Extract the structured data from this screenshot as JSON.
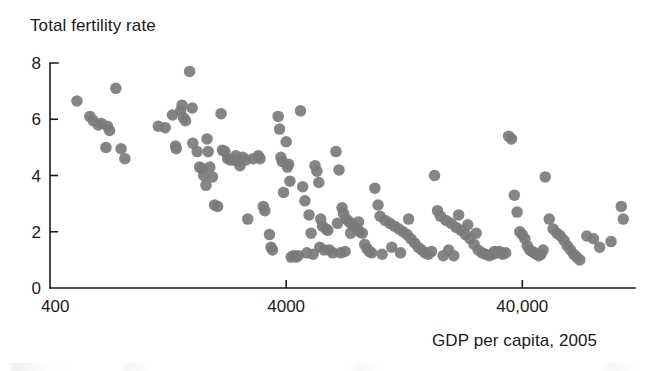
{
  "chart_data": {
    "type": "scatter",
    "title": "",
    "ylabel": "Total fertility rate",
    "xlabel": "GDP per capita, 2005",
    "xscale": "log",
    "yscale": "linear",
    "xtick_labels": [
      "400",
      "4000",
      "40,000"
    ],
    "xtick_values": [
      400,
      4000,
      40000
    ],
    "ytick_labels": [
      "0",
      "2",
      "4",
      "6",
      "8"
    ],
    "ytick_values": [
      0,
      2,
      4,
      6,
      8
    ],
    "xlim": [
      400,
      120000
    ],
    "ylim": [
      0,
      8
    ],
    "grid": false,
    "legend": null,
    "marker": {
      "shape": "circle",
      "color": "#7b7b7b",
      "diameter_px": 11.5
    },
    "points": [
      [
        520,
        6.65
      ],
      [
        590,
        6.1
      ],
      [
        610,
        5.95
      ],
      [
        640,
        5.8
      ],
      [
        660,
        5.85
      ],
      [
        700,
        5.75
      ],
      [
        715,
        5.6
      ],
      [
        690,
        5.0
      ],
      [
        760,
        7.1
      ],
      [
        800,
        4.95
      ],
      [
        830,
        4.6
      ],
      [
        1150,
        5.75
      ],
      [
        1230,
        5.7
      ],
      [
        1320,
        6.15
      ],
      [
        1360,
        5.05
      ],
      [
        1370,
        4.95
      ],
      [
        1430,
        6.3
      ],
      [
        1450,
        6.5
      ],
      [
        1470,
        6.05
      ],
      [
        1500,
        5.95
      ],
      [
        1560,
        7.7
      ],
      [
        1600,
        6.4
      ],
      [
        1610,
        5.15
      ],
      [
        1680,
        4.85
      ],
      [
        1720,
        4.3
      ],
      [
        1760,
        4.25
      ],
      [
        1790,
        4.0
      ],
      [
        1830,
        3.65
      ],
      [
        1850,
        5.3
      ],
      [
        1870,
        4.85
      ],
      [
        1900,
        4.3
      ],
      [
        1950,
        3.95
      ],
      [
        1990,
        2.95
      ],
      [
        2050,
        2.9
      ],
      [
        2120,
        6.2
      ],
      [
        2150,
        4.9
      ],
      [
        2200,
        4.85
      ],
      [
        2260,
        4.6
      ],
      [
        2320,
        4.55
      ],
      [
        2380,
        4.55
      ],
      [
        2450,
        4.7
      ],
      [
        2500,
        4.5
      ],
      [
        2550,
        4.35
      ],
      [
        2620,
        4.65
      ],
      [
        2700,
        4.55
      ],
      [
        2750,
        2.45
      ],
      [
        2900,
        4.6
      ],
      [
        3050,
        4.7
      ],
      [
        3100,
        4.6
      ],
      [
        3200,
        2.9
      ],
      [
        3250,
        2.75
      ],
      [
        3400,
        1.9
      ],
      [
        3450,
        1.45
      ],
      [
        3500,
        1.35
      ],
      [
        3700,
        6.1
      ],
      [
        3750,
        5.65
      ],
      [
        3800,
        4.65
      ],
      [
        3850,
        4.5
      ],
      [
        3900,
        3.4
      ],
      [
        4000,
        5.2
      ],
      [
        4050,
        4.3
      ],
      [
        4100,
        4.4
      ],
      [
        4150,
        3.8
      ],
      [
        4200,
        1.1
      ],
      [
        4300,
        1.15
      ],
      [
        4400,
        1.1
      ],
      [
        4500,
        1.15
      ],
      [
        4600,
        6.3
      ],
      [
        4700,
        3.6
      ],
      [
        4800,
        3.1
      ],
      [
        5000,
        2.6
      ],
      [
        5100,
        1.95
      ],
      [
        5300,
        4.35
      ],
      [
        5400,
        4.15
      ],
      [
        5500,
        3.75
      ],
      [
        5600,
        2.45
      ],
      [
        5700,
        2.2
      ],
      [
        5900,
        2.1
      ],
      [
        6000,
        2.05
      ],
      [
        6100,
        1.35
      ],
      [
        6300,
        1.25
      ],
      [
        6500,
        4.85
      ],
      [
        6700,
        4.2
      ],
      [
        6900,
        2.85
      ],
      [
        7000,
        2.65
      ],
      [
        7200,
        2.45
      ],
      [
        7400,
        2.35
      ],
      [
        7600,
        2.25
      ],
      [
        7800,
        2.15
      ],
      [
        8000,
        2.1
      ],
      [
        8200,
        2.0
      ],
      [
        8400,
        1.95
      ],
      [
        8600,
        1.55
      ],
      [
        8800,
        1.4
      ],
      [
        9000,
        1.3
      ],
      [
        9500,
        3.55
      ],
      [
        9800,
        2.95
      ],
      [
        10000,
        2.55
      ],
      [
        10500,
        2.4
      ],
      [
        11000,
        2.3
      ],
      [
        11500,
        2.2
      ],
      [
        12000,
        2.1
      ],
      [
        12500,
        2.0
      ],
      [
        13000,
        1.9
      ],
      [
        13500,
        1.75
      ],
      [
        14000,
        1.6
      ],
      [
        14500,
        1.45
      ],
      [
        15000,
        1.35
      ],
      [
        15500,
        1.25
      ],
      [
        16000,
        1.2
      ],
      [
        17000,
        4.0
      ],
      [
        17500,
        2.75
      ],
      [
        18000,
        2.55
      ],
      [
        19000,
        2.4
      ],
      [
        20000,
        2.3
      ],
      [
        21000,
        2.15
      ],
      [
        22000,
        2.05
      ],
      [
        23000,
        1.9
      ],
      [
        24000,
        1.75
      ],
      [
        25000,
        1.55
      ],
      [
        26000,
        1.35
      ],
      [
        27000,
        1.25
      ],
      [
        28000,
        1.2
      ],
      [
        29000,
        1.15
      ],
      [
        30000,
        1.2
      ],
      [
        31000,
        1.25
      ],
      [
        32000,
        1.3
      ],
      [
        33000,
        1.2
      ],
      [
        34000,
        1.25
      ],
      [
        35000,
        5.4
      ],
      [
        36000,
        5.3
      ],
      [
        37000,
        3.3
      ],
      [
        38000,
        2.7
      ],
      [
        39000,
        2.0
      ],
      [
        40000,
        1.9
      ],
      [
        41000,
        1.75
      ],
      [
        42000,
        1.5
      ],
      [
        43000,
        1.35
      ],
      [
        44000,
        1.3
      ],
      [
        45000,
        1.25
      ],
      [
        46000,
        1.2
      ],
      [
        47000,
        1.15
      ],
      [
        48000,
        1.2
      ],
      [
        49000,
        1.35
      ],
      [
        50000,
        3.95
      ],
      [
        52000,
        2.45
      ],
      [
        54000,
        2.1
      ],
      [
        56000,
        1.95
      ],
      [
        58000,
        1.85
      ],
      [
        60000,
        1.7
      ],
      [
        62000,
        1.5
      ],
      [
        64000,
        1.35
      ],
      [
        66000,
        1.2
      ],
      [
        68000,
        1.1
      ],
      [
        70000,
        1.0
      ],
      [
        75000,
        1.85
      ],
      [
        80000,
        1.75
      ],
      [
        85000,
        1.45
      ],
      [
        95000,
        1.65
      ],
      [
        105000,
        2.9
      ],
      [
        107000,
        2.45
      ],
      [
        30500,
        1.3
      ],
      [
        25500,
        1.95
      ],
      [
        20500,
        1.15
      ],
      [
        18500,
        1.15
      ],
      [
        16500,
        1.3
      ],
      [
        12200,
        1.25
      ],
      [
        10200,
        1.2
      ],
      [
        9200,
        1.25
      ],
      [
        7100,
        1.3
      ],
      [
        6800,
        1.25
      ],
      [
        5800,
        1.35
      ],
      [
        5200,
        1.2
      ],
      [
        4900,
        1.25
      ],
      [
        23500,
        2.25
      ],
      [
        21500,
        2.6
      ],
      [
        19500,
        1.35
      ],
      [
        13200,
        2.45
      ],
      [
        11200,
        1.45
      ],
      [
        8100,
        2.35
      ],
      [
        7500,
        1.95
      ],
      [
        6600,
        2.3
      ],
      [
        5550,
        1.45
      ]
    ]
  },
  "axes": {
    "y_axis_title": "Total fertility rate",
    "x_axis_title": "GDP per capita, 2005",
    "y_ticks": [
      "8",
      "6",
      "4",
      "2",
      "0"
    ],
    "x_ticks": [
      "400",
      "4000",
      "40,000"
    ]
  },
  "style": {
    "point_color": "#7b7b7b",
    "axis_color": "#1a1a1a",
    "background": "#ffffff"
  }
}
